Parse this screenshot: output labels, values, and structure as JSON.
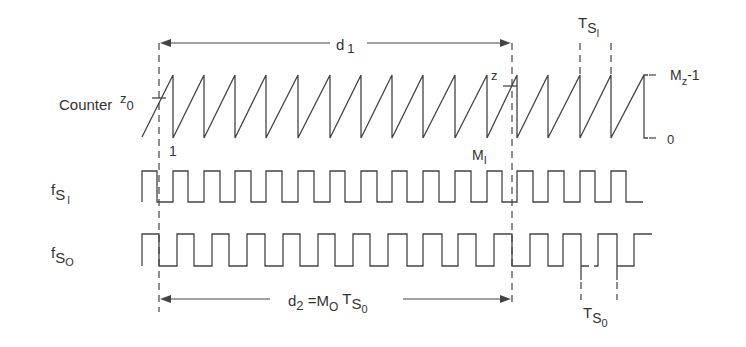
{
  "diagram": {
    "type": "timing-diagram",
    "rows": [
      {
        "id": "counter",
        "label": "Counter"
      },
      {
        "id": "fsi",
        "label_main": "f",
        "label_sub": "S",
        "label_subsub": "I"
      },
      {
        "id": "fso",
        "label_main": "f",
        "label_sub": "S",
        "label_subsub": "O"
      }
    ],
    "annotations": {
      "z0_main": "z",
      "z0_sub": "0",
      "start_count": "1",
      "z_label": "z",
      "mi_main": "M",
      "mi_sub": "I",
      "d1_main": "d",
      "d1_sub": "1",
      "tsi_main": "T",
      "tsi_sub": "S",
      "tsi_subsub": "I",
      "level_top_main": "M",
      "level_top_sub": "z",
      "level_top_suffix": "-1",
      "level_bottom": "0",
      "d2_main": "d",
      "d2_sub": "2",
      "d2_eq": " =M",
      "d2_mo_sub": "O",
      "d2_t": " T",
      "d2_s": "S",
      "d2_s_sub": "0",
      "tso_main": "T",
      "tso_sub": "S",
      "tso_subsub": "0"
    },
    "colors": {
      "line": "#444444",
      "text": "#333333",
      "background": "#ffffff"
    }
  }
}
